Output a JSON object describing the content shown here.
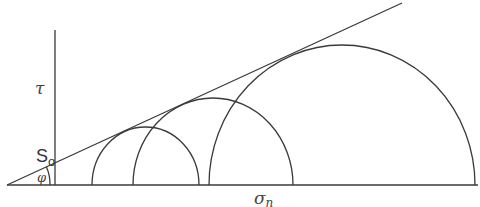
{
  "diagram": {
    "labels": {
      "tau": "τ",
      "sigma": "σ",
      "sigma_sub": "n",
      "cohesion": "S",
      "cohesion_sub": "o",
      "phi": "φ"
    },
    "axes": {
      "origin": [
        55,
        185
      ],
      "tau_axis_top": 30,
      "sigma_axis_left": 7,
      "sigma_axis_right": 478
    },
    "envelope": {
      "x1": 7,
      "y1": 185,
      "x2": 402,
      "y2": 3
    },
    "circles": [
      {
        "name": "circle-small",
        "left": 92,
        "right": 199,
        "top": 127
      },
      {
        "name": "circle-medium",
        "left": 133,
        "right": 293,
        "top": 98
      },
      {
        "name": "circle-large",
        "left": 209,
        "right": 475,
        "top": 45
      }
    ],
    "colors": {
      "line": "#3a3a3a",
      "label": "#444444"
    }
  }
}
